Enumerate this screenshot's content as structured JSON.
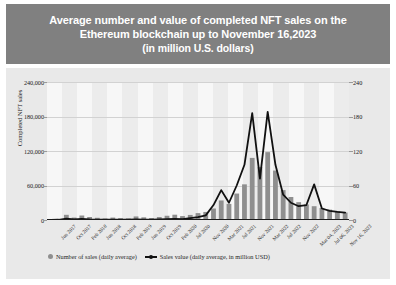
{
  "title": {
    "line1": "Average number and value of completed NFT sales on the",
    "line2": "Ethereum blockchain up to November 16,2023",
    "line3": "(in million U.S. dollars)"
  },
  "axes": {
    "left_title": "Completed NFT sales",
    "left_ticks": [
      "0",
      "60,000",
      "120,000",
      "180,000",
      "240,000"
    ],
    "right_ticks": [
      "0",
      "60",
      "120",
      "180",
      "240"
    ]
  },
  "legend": {
    "bars_label": "Number of sales (daily average)",
    "line_label": "Sales value (daily average, in million USD)",
    "bars_color": "#8f8f8f",
    "line_color": "#111111"
  },
  "colors": {
    "banner_bg": "#808080",
    "banner_text": "#ffffff",
    "card_bg": "#e9e9e9",
    "plot_bg": "#ececec",
    "band": "#f7f7f7",
    "grid": "#d2d2d2",
    "axis": "#1a1a1a"
  },
  "chart_data": {
    "type": "bar",
    "title": "Average number and value of completed NFT sales on the Ethereum blockchain up to November 16,2023 (in million U.S. dollars)",
    "xlabel": "",
    "ylabel": "Completed NFT sales",
    "ylabel_right": "Sales value (daily average, in million USD)",
    "ylim": [
      0,
      240000
    ],
    "ylim_right": [
      0,
      240
    ],
    "grid": true,
    "legend_position": "bottom",
    "tick_labels": [
      "Jun 2017",
      "Oct 2017",
      "Feb 2018",
      "Jun 2018",
      "Oct 2018",
      "Feb 2019",
      "Jun 2019",
      "Oct 2019",
      "Feb 2020",
      "Jul 2020",
      "Nov 2020",
      "Mar 2021",
      "Jul 2021",
      "Nov 2021",
      "Mar 2022",
      "Jul 2022",
      "Nov 2022",
      "Mar 04, 2023",
      "Jul 06, 2023",
      "Nov 16, 2023"
    ],
    "categories": [
      "Jun 2017",
      "Aug 2017",
      "Oct 2017",
      "Dec 2017",
      "Feb 2018",
      "Apr 2018",
      "Jun 2018",
      "Aug 2018",
      "Oct 2018",
      "Dec 2018",
      "Feb 2019",
      "Apr 2019",
      "Jun 2019",
      "Aug 2019",
      "Oct 2019",
      "Dec 2019",
      "Feb 2020",
      "Apr 2020",
      "Jul 2020",
      "Sep 2020",
      "Nov 2020",
      "Jan 2021",
      "Mar 2021",
      "May 2021",
      "Jul 2021",
      "Sep 2021",
      "Nov 2021",
      "Jan 2022",
      "Mar 2022",
      "May 2022",
      "Jul 2022",
      "Sep 2022",
      "Nov 2022",
      "Jan 2023",
      "Mar 04, 2023",
      "May 2023",
      "Jul 06, 2023",
      "Sep 2023",
      "Nov 16, 2023"
    ],
    "series": [
      {
        "name": "Number of sales (daily average)",
        "axis": "left",
        "type": "bar",
        "color": "#8f8f8f",
        "values": [
          600,
          1800,
          9000,
          4200,
          7800,
          5200,
          3800,
          2600,
          4200,
          3200,
          2800,
          6200,
          4600,
          3400,
          5200,
          7400,
          9200,
          6800,
          8800,
          12000,
          14000,
          20000,
          34000,
          28000,
          46000,
          62000,
          108000,
          92000,
          118000,
          86000,
          52000,
          40000,
          31000,
          27000,
          24000,
          21000,
          18000,
          15500,
          13000
        ]
      },
      {
        "name": "Sales value (daily average, in million USD)",
        "axis": "right",
        "type": "line",
        "color": "#111111",
        "values": [
          0.2,
          0.4,
          2.2,
          1.1,
          1.8,
          0.9,
          0.6,
          0.5,
          0.7,
          0.6,
          0.5,
          0.9,
          0.8,
          0.7,
          1.0,
          1.4,
          2.1,
          1.6,
          3.2,
          5.0,
          8.0,
          26.0,
          52.0,
          30.0,
          60.0,
          96.0,
          186.0,
          72.0,
          188.0,
          96.0,
          44.0,
          30.0,
          24.0,
          26.0,
          62.0,
          20.0,
          16.0,
          14.0,
          13.0
        ]
      }
    ]
  }
}
